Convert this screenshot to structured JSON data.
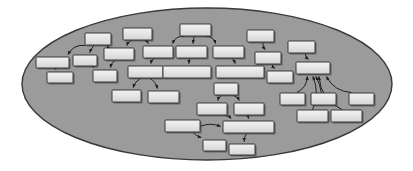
{
  "figure": {
    "type": "node-link-diagram",
    "title": "",
    "canvas": {
      "width": 413,
      "height": 171,
      "background": "#ffffff"
    },
    "container": {
      "shape": "ellipse",
      "name": "boundary-ellipse",
      "cx": 207,
      "cy": 84,
      "rx": 185,
      "ry": 76,
      "fill": "#9b9b9b",
      "stroke": "#3a3a3a",
      "stroke_width": 1.4
    },
    "style": {
      "node_fill": "#e3e3e3",
      "node_fill_top": "#f1f1f1",
      "node_stroke": "#2b2b2b",
      "node_stroke_width": 0.9,
      "node_shadow": "#4a4a4a",
      "node_shadow_offset": 1.6,
      "edge_stroke": "#1e1e1e",
      "edge_stroke_width": 1.0,
      "arrow_size": 3.2,
      "node_corner_radius": 0.8
    },
    "counts": {
      "nodes": 41,
      "edges": 36
    }
  },
  "nodes": [
    {
      "id": "n1",
      "name": "node-1",
      "x": 36,
      "y": 57,
      "w": 33,
      "h": 11
    },
    {
      "id": "n2",
      "name": "node-2",
      "x": 73,
      "y": 55,
      "w": 24,
      "h": 11
    },
    {
      "id": "n3",
      "name": "node-3",
      "x": 85,
      "y": 33,
      "w": 26,
      "h": 12
    },
    {
      "id": "n4",
      "name": "node-4",
      "x": 47,
      "y": 72,
      "w": 26,
      "h": 11
    },
    {
      "id": "n5",
      "name": "node-5",
      "x": 93,
      "y": 70,
      "w": 24,
      "h": 12
    },
    {
      "id": "n6",
      "name": "node-6",
      "x": 104,
      "y": 48,
      "w": 30,
      "h": 12
    },
    {
      "id": "n7",
      "name": "node-7",
      "x": 123,
      "y": 28,
      "w": 29,
      "h": 12
    },
    {
      "id": "n8",
      "name": "node-8",
      "x": 143,
      "y": 46,
      "w": 30,
      "h": 12
    },
    {
      "id": "n9",
      "name": "node-9",
      "x": 128,
      "y": 66,
      "w": 35,
      "h": 12
    },
    {
      "id": "n10",
      "name": "node-10",
      "x": 112,
      "y": 90,
      "w": 29,
      "h": 12
    },
    {
      "id": "n11",
      "name": "node-11",
      "x": 148,
      "y": 91,
      "w": 31,
      "h": 12
    },
    {
      "id": "n12",
      "name": "node-12",
      "x": 180,
      "y": 24,
      "w": 31,
      "h": 12
    },
    {
      "id": "n13",
      "name": "node-13",
      "x": 176,
      "y": 46,
      "w": 31,
      "h": 12
    },
    {
      "id": "n14",
      "name": "node-14",
      "x": 163,
      "y": 66,
      "w": 48,
      "h": 12
    },
    {
      "id": "n15",
      "name": "node-15",
      "x": 213,
      "y": 46,
      "w": 31,
      "h": 12
    },
    {
      "id": "n16",
      "name": "node-16",
      "x": 216,
      "y": 66,
      "w": 48,
      "h": 12
    },
    {
      "id": "n17",
      "name": "node-17",
      "x": 247,
      "y": 30,
      "w": 27,
      "h": 12
    },
    {
      "id": "n18",
      "name": "node-18",
      "x": 255,
      "y": 52,
      "w": 26,
      "h": 12
    },
    {
      "id": "n19",
      "name": "node-19",
      "x": 267,
      "y": 71,
      "w": 26,
      "h": 12
    },
    {
      "id": "n20",
      "name": "node-20",
      "x": 288,
      "y": 41,
      "w": 27,
      "h": 12
    },
    {
      "id": "n21",
      "name": "node-21",
      "x": 296,
      "y": 62,
      "w": 34,
      "h": 12
    },
    {
      "id": "n22",
      "name": "node-22",
      "x": 280,
      "y": 93,
      "w": 25,
      "h": 12
    },
    {
      "id": "n23",
      "name": "node-23",
      "x": 311,
      "y": 93,
      "w": 25,
      "h": 12
    },
    {
      "id": "n24",
      "name": "node-24",
      "x": 349,
      "y": 93,
      "w": 25,
      "h": 12
    },
    {
      "id": "n25",
      "name": "node-25",
      "x": 297,
      "y": 110,
      "w": 31,
      "h": 12
    },
    {
      "id": "n26",
      "name": "node-26",
      "x": 331,
      "y": 110,
      "w": 31,
      "h": 12
    },
    {
      "id": "n27",
      "name": "node-27",
      "x": 214,
      "y": 83,
      "w": 24,
      "h": 12
    },
    {
      "id": "n28",
      "name": "node-28",
      "x": 197,
      "y": 103,
      "w": 30,
      "h": 12
    },
    {
      "id": "n29",
      "name": "node-29",
      "x": 234,
      "y": 103,
      "w": 30,
      "h": 12
    },
    {
      "id": "n30",
      "name": "node-30",
      "x": 165,
      "y": 120,
      "w": 35,
      "h": 12
    },
    {
      "id": "n31",
      "name": "node-31",
      "x": 223,
      "y": 121,
      "w": 51,
      "h": 12
    },
    {
      "id": "n32",
      "name": "node-32",
      "x": 203,
      "y": 140,
      "w": 23,
      "h": 11
    },
    {
      "id": "n33",
      "name": "node-33",
      "x": 229,
      "y": 144,
      "w": 26,
      "h": 11
    }
  ],
  "edges": [
    {
      "name": "edge-n3-n1",
      "from": "n3",
      "to": "n1",
      "bow": 0.35
    },
    {
      "name": "edge-n3-n2",
      "from": "n3",
      "to": "n2",
      "bow": 0.12
    },
    {
      "name": "edge-n3-n6",
      "from": "n3",
      "to": "n6",
      "bow": -0.25
    },
    {
      "name": "edge-n1-n4",
      "from": "n1",
      "to": "n4",
      "bow": 0.1
    },
    {
      "name": "edge-n2-n5",
      "from": "n2",
      "to": "n5",
      "bow": -0.1
    },
    {
      "name": "edge-n6-n5",
      "from": "n6",
      "to": "n5",
      "bow": 0.2
    },
    {
      "name": "edge-n7-n6",
      "from": "n7",
      "to": "n6",
      "bow": 0.25
    },
    {
      "name": "edge-n7-n8",
      "from": "n7",
      "to": "n8",
      "bow": -0.2
    },
    {
      "name": "edge-n8-n9",
      "from": "n8",
      "to": "n9",
      "bow": 0.2
    },
    {
      "name": "edge-n9-n10",
      "from": "n9",
      "to": "n10",
      "bow": 0.22
    },
    {
      "name": "edge-n9-n11",
      "from": "n9",
      "to": "n11",
      "bow": -0.22
    },
    {
      "name": "edge-n12-n8",
      "from": "n12",
      "to": "n8",
      "bow": 0.4
    },
    {
      "name": "edge-n12-n13",
      "from": "n12",
      "to": "n13",
      "bow": 0.05
    },
    {
      "name": "edge-n12-n15",
      "from": "n12",
      "to": "n15",
      "bow": -0.4
    },
    {
      "name": "edge-n13-n14",
      "from": "n13",
      "to": "n14",
      "bow": 0.12
    },
    {
      "name": "edge-n15-n16",
      "from": "n15",
      "to": "n16",
      "bow": -0.12
    },
    {
      "name": "edge-n17-n18",
      "from": "n17",
      "to": "n18",
      "bow": 0.18
    },
    {
      "name": "edge-n18-n19",
      "from": "n18",
      "to": "n19",
      "bow": 0.18
    },
    {
      "name": "edge-n20-n21",
      "from": "n20",
      "to": "n21",
      "bow": 0.16
    },
    {
      "name": "edge-n22-n21",
      "from": "n22",
      "to": "n21",
      "bow": 0.3
    },
    {
      "name": "edge-n23-n21",
      "from": "n23",
      "to": "n21",
      "bow": 0.1
    },
    {
      "name": "edge-n24-n21",
      "from": "n24",
      "to": "n21",
      "bow": -0.28
    },
    {
      "name": "edge-n25-n21",
      "from": "n25",
      "to": "n21",
      "bow": 0.22
    },
    {
      "name": "edge-n26-n21",
      "from": "n26",
      "to": "n21",
      "bow": -0.3
    },
    {
      "name": "edge-n27-n28",
      "from": "n27",
      "to": "n28",
      "bow": 0.25
    },
    {
      "name": "edge-n27-n29",
      "from": "n27",
      "to": "n29",
      "bow": -0.25
    },
    {
      "name": "edge-n28-n31",
      "from": "n28",
      "to": "n31",
      "bow": -0.2
    },
    {
      "name": "edge-n29-n31",
      "from": "n29",
      "to": "n31",
      "bow": 0.2
    },
    {
      "name": "edge-n30-n31",
      "from": "n30",
      "to": "n31",
      "bow": -0.22
    },
    {
      "name": "edge-n30-n32",
      "from": "n30",
      "to": "n32",
      "bow": 0.18
    },
    {
      "name": "edge-n31-n33",
      "from": "n31",
      "to": "n33",
      "bow": 0.18
    }
  ]
}
